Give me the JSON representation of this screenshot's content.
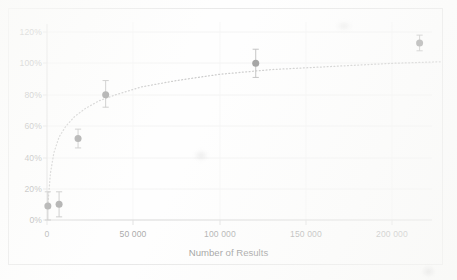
{
  "chart_data": {
    "type": "scatter",
    "title": "",
    "subtitle": "",
    "xlabel": "Number of Results",
    "ylabel": "",
    "xlim": [
      -8000,
      230000
    ],
    "ylim": [
      0,
      125
    ],
    "xticks": [
      0,
      50000,
      100000,
      150000,
      200000
    ],
    "xtick_labels": [
      "0",
      "50 000",
      "100 000",
      "150 000",
      "200 000"
    ],
    "yticks": [
      0,
      20,
      40,
      60,
      80,
      100,
      120
    ],
    "ytick_labels": [
      "0%",
      "20%",
      "40%",
      "60%",
      "80%",
      "100%",
      "120%"
    ],
    "grid": "horizontal-and-vertical-faint",
    "legend": "none",
    "marker_color": "#5a5a5a",
    "errorbar_color": "#8a8a8a",
    "trendline_color": "#a0a0a0",
    "trendline_style": "dotted",
    "series": [
      {
        "name": "Recall vs Number of Results",
        "x": [
          500,
          7000,
          18000,
          34000,
          121000,
          216000
        ],
        "y": [
          9,
          10,
          52,
          80,
          100,
          113
        ],
        "yerr_low": [
          9,
          8,
          6,
          8,
          9,
          5
        ],
        "yerr_high": [
          9,
          8,
          6,
          9,
          9,
          5
        ]
      }
    ],
    "trendline": {
      "description": "dotted logarithmic fit rising steeply then flattening toward 100%",
      "points_x": [
        600,
        2000,
        4000,
        7000,
        11000,
        16000,
        22000,
        30000,
        40000,
        55000,
        75000,
        100000,
        130000,
        165000,
        200000,
        228000
      ],
      "points_y": [
        11,
        30,
        43,
        53,
        60,
        66,
        71,
        76,
        80,
        85,
        89,
        93,
        96,
        98,
        100,
        101
      ]
    }
  },
  "axis": {
    "x_title": "Number of Results"
  }
}
